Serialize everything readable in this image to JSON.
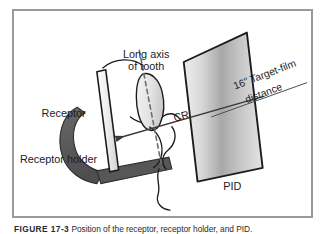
{
  "figure": {
    "frame_border_color": "#9a9a9a",
    "background_color": "#ffffff",
    "labels": {
      "long_axis_line1": "Long axis",
      "long_axis_line2": "of tooth",
      "receptor": "Receptor",
      "receptor_holder": "Receptor holder",
      "central_ray": "CR",
      "target_film_line1": "16\" Target-film",
      "target_film_line2": "distance",
      "pid": "PID"
    },
    "colors": {
      "holder_fill": "#595959",
      "receptor_fill": "#efefef",
      "pid_light": "#e8e8e8",
      "pid_dark": "#9e9e9e",
      "tooth_fill": "#e9e9e9",
      "outline": "#1c1c1c",
      "ray_line": "#3a3a3a"
    }
  },
  "caption": {
    "label": "FIGURE 17-3",
    "text": "Position of the receptor, receptor holder, and PID."
  }
}
